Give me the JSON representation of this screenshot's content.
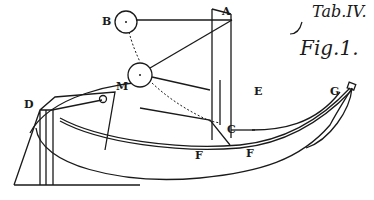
{
  "caption": {
    "plate": "Tab.IV.",
    "figure": "Fig.1."
  },
  "labels": {
    "A": "A",
    "B": "B",
    "M": "M",
    "D": "D",
    "E": "E",
    "C": "C",
    "F1": "F",
    "F2": "F",
    "G": "G"
  },
  "colors": {
    "ink": "#1a1a1a",
    "paper": "#ffffff"
  }
}
